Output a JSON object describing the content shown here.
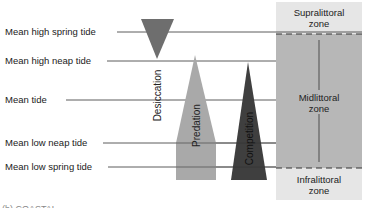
{
  "tide_levels": [
    {
      "label": "Mean high spring tide",
      "y": 32
    },
    {
      "label": "Mean high neap tide",
      "y": 61
    },
    {
      "label": "Mean tide",
      "y": 100
    },
    {
      "label": "Mean low neap tide",
      "y": 143
    },
    {
      "label": "Mean low spring tide",
      "y": 167
    }
  ],
  "factors": [
    {
      "label": "Desiccation",
      "shape": "inverted-triangle",
      "color": "#6e6e6e"
    },
    {
      "label": "Predation",
      "shape": "pointed-bar",
      "color": "#a9a9a9"
    },
    {
      "label": "Competition",
      "shape": "triangle",
      "color": "#3f3f3f"
    }
  ],
  "zones": [
    {
      "label_line1": "Supralittoral",
      "label_line2": "zone",
      "color": "#e6e6e6"
    },
    {
      "label_line1": "Midlittoral",
      "label_line2": "zone",
      "color": "#b7b7b7"
    },
    {
      "label_line1": "Infralittoral",
      "label_line2": "zone",
      "color": "#e6e6e6"
    }
  ],
  "caption": "(b) COASTAL..."
}
